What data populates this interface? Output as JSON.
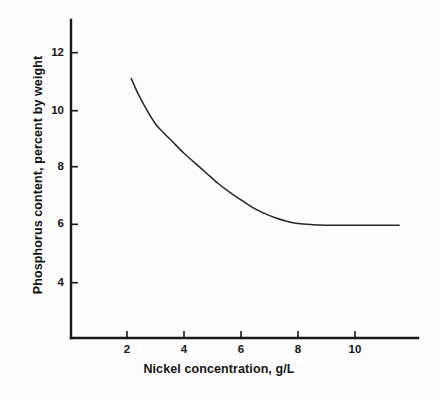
{
  "chart_data": {
    "type": "line",
    "title": "",
    "xlabel": "Nickel concentration, g/L",
    "ylabel": "Phosphorus content, percent by weight",
    "xlim": [
      0,
      12.2
    ],
    "ylim": [
      2.9,
      12.7
    ],
    "xticks": [
      2,
      4,
      6,
      8,
      10
    ],
    "yticks": [
      4,
      6,
      8,
      10,
      12
    ],
    "xtick_labels": [
      "2",
      "4",
      "6",
      "8",
      "10"
    ],
    "ytick_labels": [
      "4",
      "6",
      "8",
      "10",
      "12"
    ],
    "grid": false,
    "legend": null,
    "series": [
      {
        "name": "Phosphorus content vs nickel concentration",
        "color": "#262626",
        "x": [
          2.15,
          2.4,
          2.7,
          3.0,
          3.3,
          3.6,
          4.0,
          4.4,
          4.8,
          5.2,
          5.6,
          6.0,
          6.4,
          6.8,
          7.2,
          7.6,
          8.0,
          8.5,
          9.0,
          9.5,
          10.0,
          10.5,
          11.0,
          11.55
        ],
        "y": [
          11.1,
          10.55,
          10.0,
          9.52,
          9.2,
          8.9,
          8.5,
          8.15,
          7.8,
          7.45,
          7.15,
          6.88,
          6.62,
          6.42,
          6.26,
          6.14,
          6.06,
          6.02,
          6.0,
          6.0,
          6.0,
          6.0,
          6.0,
          6.0
        ]
      }
    ],
    "annotations": []
  },
  "axes": {
    "x_axis_name": "nickel-concentration-axis",
    "y_axis_name": "phosphorus-content-axis"
  },
  "colors": {
    "axis": "#1a1a1a",
    "curve": "#262626",
    "text": "#141414",
    "background": "#fdfdfd"
  }
}
